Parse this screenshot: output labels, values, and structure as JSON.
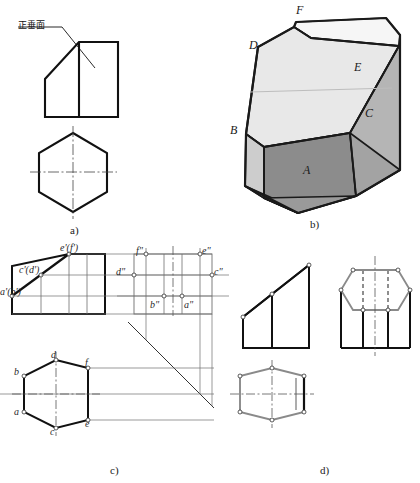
{
  "figure": {
    "panels": [
      {
        "id": "a",
        "caption": "a)",
        "description": "立体图标注正垂面的两视图"
      },
      {
        "id": "b",
        "caption": "b)",
        "description": "截切后六棱柱的轴测图"
      },
      {
        "id": "c",
        "caption": "c)",
        "description": "三视图作图过程（点的投影）"
      },
      {
        "id": "d",
        "caption": "d)",
        "description": "完成的三视图"
      }
    ]
  },
  "panel_a": {
    "caption": "a)",
    "annotation": "正垂面",
    "leader_from": [
      62,
      22
    ],
    "leader_to": [
      95,
      67
    ],
    "front_view": {
      "name": "front-view-a",
      "outline": [
        [
          45,
          117
        ],
        [
          45,
          78
        ],
        [
          78,
          41
        ],
        [
          118,
          41
        ],
        [
          118,
          117
        ]
      ],
      "inner_vertical": [
        [
          78,
          41
        ],
        [
          78,
          117
        ]
      ]
    },
    "top_view": {
      "name": "top-view-a",
      "hexagon": [
        [
          73,
          134
        ],
        [
          107,
          154
        ],
        [
          107,
          191
        ],
        [
          73,
          211
        ],
        [
          39,
          191
        ],
        [
          39,
          154
        ]
      ],
      "center_v": [
        [
          73,
          128
        ],
        [
          73,
          217
        ]
      ],
      "center_h": [
        [
          32,
          172
        ],
        [
          114,
          172
        ]
      ]
    }
  },
  "panel_b": {
    "caption": "b)",
    "vertex_labels": [
      {
        "name": "F",
        "x": 296,
        "y": 8
      },
      {
        "name": "D",
        "x": 249,
        "y": 43
      },
      {
        "name": "E",
        "x": 354,
        "y": 64
      },
      {
        "name": "C",
        "x": 365,
        "y": 110
      },
      {
        "name": "B",
        "x": 231,
        "y": 127
      },
      {
        "name": "A",
        "x": 304,
        "y": 167
      }
    ],
    "colors": {
      "top_face": "#e9e9e9",
      "left_face": "#cfcfcf",
      "front_face": "#8d8d8d",
      "right_face": "#b4b4b4",
      "back_sliver": "#f4f4f4",
      "edge": "#1a1a1a"
    }
  },
  "panel_c": {
    "caption": "c)",
    "front_labels": [
      {
        "text": "e'(f')",
        "x": 64,
        "y": 247
      },
      {
        "text": "c'(d')",
        "x": 23,
        "y": 269
      },
      {
        "text": "a'(b')",
        "x": 2,
        "y": 292
      }
    ],
    "side_labels": [
      {
        "text": "f\"",
        "x": 136,
        "y": 250
      },
      {
        "text": "e\"",
        "x": 204,
        "y": 250
      },
      {
        "text": "d\"",
        "x": 116,
        "y": 272
      },
      {
        "text": "c\"",
        "x": 213,
        "y": 272
      },
      {
        "text": "b\"",
        "x": 151,
        "y": 306
      },
      {
        "text": "a\"",
        "x": 185,
        "y": 306
      }
    ],
    "top_labels": [
      {
        "text": "d",
        "x": 52,
        "y": 355
      },
      {
        "text": "f",
        "x": 84,
        "y": 362
      },
      {
        "text": "b",
        "x": 18,
        "y": 370
      },
      {
        "text": "a",
        "x": 18,
        "y": 412
      },
      {
        "text": "e",
        "x": 84,
        "y": 424
      },
      {
        "text": "c",
        "x": 51,
        "y": 432
      }
    ],
    "front_view": {
      "outline": [
        [
          12,
          295
        ],
        [
          12,
          264
        ],
        [
          40,
          264
        ],
        [
          40,
          250
        ],
        [
          68,
          250
        ],
        [
          68,
          250
        ]
      ],
      "cut_line": [
        [
          12,
          295
        ],
        [
          68,
          252
        ]
      ]
    },
    "miter_line": {
      "from": [
        130,
        323
      ],
      "to": [
        215,
        408
      ],
      "angle": 45
    }
  },
  "panel_d": {
    "caption": "d)",
    "views": [
      "front-view-d",
      "side-view-d",
      "top-view-d"
    ],
    "colors": {
      "visible_edge": "#111111",
      "highlight_edge": "#8a8a8a",
      "hidden_edge": "#555555"
    }
  },
  "style": {
    "paper": "#ffffff",
    "ink": "#111111",
    "thin": "#6f6f6f",
    "center_line": "#555555"
  }
}
